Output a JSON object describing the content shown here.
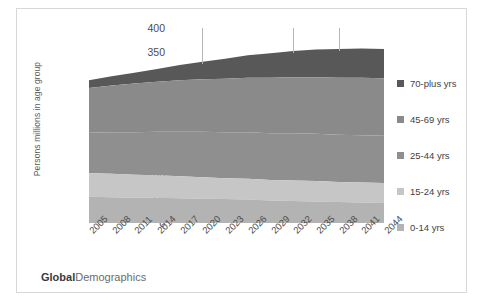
{
  "branding": {
    "bold": "Global",
    "regular": "Demographics"
  },
  "chart_data": {
    "type": "area",
    "title": "",
    "subtitle": "",
    "xlabel": "",
    "ylabel": "Persons millions in age group",
    "ylim": [
      0,
      400
    ],
    "ytick_step": 50,
    "yticks": [
      "0",
      "50",
      "100",
      "150",
      "200",
      "250",
      "300",
      "350",
      "400"
    ],
    "grid": false,
    "legend_position": "right",
    "stack_order_bottom_to_top": [
      "0-14 yrs",
      "15-24 yrs",
      "25-44 yrs",
      "45-69 yrs",
      "70-plus yrs"
    ],
    "x": [
      "2005",
      "2008",
      "2011",
      "2014",
      "2017",
      "2020",
      "2023",
      "2026",
      "2029",
      "2032",
      "2035",
      "2038",
      "2041",
      "2044"
    ],
    "categories": [
      "2005",
      "2008",
      "2011",
      "2014",
      "2017",
      "2020",
      "2023",
      "2026",
      "2029",
      "2032",
      "2035",
      "2038",
      "2041",
      "2044"
    ],
    "annotation_vertical_lines": [
      "2020",
      "2032",
      "2038"
    ],
    "series": [
      {
        "name": "0-14 yrs",
        "color": "#b3b3b3",
        "values": [
          54,
          53,
          52,
          52,
          51,
          50,
          49,
          48,
          46,
          45,
          44,
          43,
          42,
          41
        ]
      },
      {
        "name": "15-24 yrs",
        "color": "#c6c6c6",
        "values": [
          48,
          48,
          47,
          46,
          45,
          44,
          43,
          43,
          42,
          42,
          42,
          41,
          41,
          41
        ]
      },
      {
        "name": "25-44 yrs",
        "color": "#8f8f8f",
        "values": [
          83,
          85,
          87,
          89,
          91,
          93,
          94,
          95,
          96,
          97,
          97,
          97,
          97,
          97
        ]
      },
      {
        "name": "45-69 yrs",
        "color": "#8a8a8a",
        "values": [
          92,
          96,
          100,
          103,
          106,
          108,
          110,
          112,
          114,
          115,
          116,
          117,
          118,
          118
        ]
      },
      {
        "name": "70-plus yrs",
        "color": "#585858",
        "values": [
          16,
          19,
          22,
          26,
          31,
          36,
          41,
          46,
          50,
          54,
          57,
          59,
          60,
          60
        ]
      }
    ],
    "totals": [
      293,
      301,
      308,
      316,
      324,
      331,
      337,
      344,
      348,
      353,
      356,
      357,
      358,
      357
    ]
  },
  "legend": {
    "items": [
      {
        "label": "70-plus yrs",
        "color": "#585858"
      },
      {
        "label": "45-69 yrs",
        "color": "#8a8a8a"
      },
      {
        "label": "25-44 yrs",
        "color": "#8f8f8f"
      },
      {
        "label": "15-24 yrs",
        "color": "#c6c6c6"
      },
      {
        "label": "0-14 yrs",
        "color": "#b3b3b3"
      }
    ]
  }
}
